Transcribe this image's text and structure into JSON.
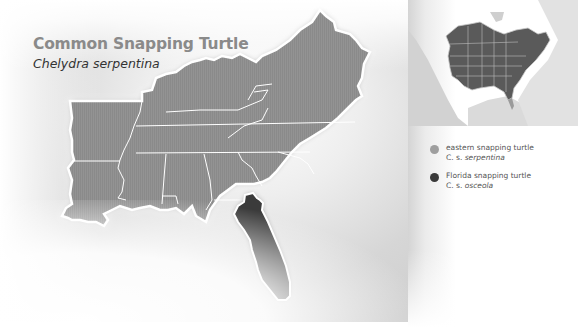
{
  "header": {
    "title": "Common Snapping Turtle",
    "subtitle": "Chelydra serpentina"
  },
  "legend": {
    "items": [
      {
        "common_name": "eastern snapping turtle",
        "abbr": "C. s.",
        "subspecies": "serpentina",
        "color": "#9e9e9e"
      },
      {
        "common_name": "Florida snapping turtle",
        "abbr": "C. s.",
        "subspecies": "osceola",
        "color": "#3a3a3a"
      }
    ]
  },
  "colors": {
    "range_eastern": "#8f8f8f",
    "range_florida": "#3b3b3b",
    "state_border": "#ffffff",
    "title_gray": "#8a8a8a",
    "inset_land_range": "#5a5a5a",
    "inset_land_other": "#cfcfcf"
  }
}
